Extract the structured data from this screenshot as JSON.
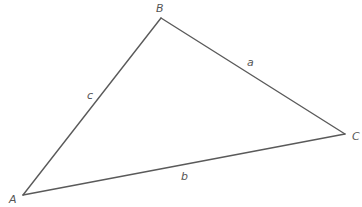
{
  "diagram": {
    "title": "",
    "type": "triangle",
    "vertices": {
      "A": {
        "label": "A",
        "x": 23,
        "y": 195
      },
      "B": {
        "label": "B",
        "x": 161,
        "y": 18
      },
      "C": {
        "label": "C",
        "x": 345,
        "y": 134
      }
    },
    "sides": {
      "a": {
        "label": "a",
        "from": "B",
        "to": "C"
      },
      "b": {
        "label": "b",
        "from": "A",
        "to": "C"
      },
      "c": {
        "label": "c",
        "from": "A",
        "to": "B"
      }
    },
    "colors": {
      "line": "#5a5a5a",
      "text": "#555555",
      "background": "#ffffff"
    }
  }
}
